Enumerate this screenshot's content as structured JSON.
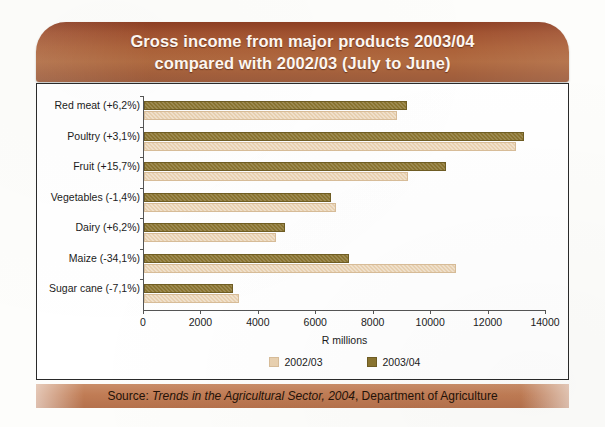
{
  "header": {
    "title_line1": "Gross income from major products 2003/04",
    "title_line2": "compared with 2002/03 (July to June)"
  },
  "source": {
    "prefix": "Source: ",
    "publication": "Trends in the Agricultural Sector, 2004",
    "suffix": ", Department of Agriculture"
  },
  "chart_data": {
    "type": "bar",
    "orientation": "horizontal",
    "title": "Gross income from major products 2003/04 compared with 2002/03 (July to June)",
    "xlabel": "R millions",
    "ylabel": "",
    "xlim": [
      0,
      14000
    ],
    "xticks": [
      0,
      2000,
      4000,
      6000,
      8000,
      10000,
      12000,
      14000
    ],
    "xtick_labels": [
      "0",
      "2000",
      "4000",
      "6000",
      "8000",
      "10000",
      "12000",
      "14000"
    ],
    "grid": false,
    "legend_position": "bottom-center",
    "categories": [
      "Red meat (+6,2%)",
      "Poultry (+3,1%)",
      "Fruit (+15,7%)",
      "Vegetables (-1,4%)",
      "Dairy (+6,2%)",
      "Maize (-34,1%)",
      "Sugar cane (-7,1%)"
    ],
    "series": [
      {
        "name": "2003/04",
        "color": "#8a7430",
        "values": [
          9150,
          13250,
          10500,
          6500,
          4900,
          7150,
          3100
        ]
      },
      {
        "name": "2002/03",
        "color": "#e9d1b0",
        "values": [
          8800,
          12950,
          9200,
          6700,
          4600,
          10850,
          3300
        ]
      }
    ]
  }
}
